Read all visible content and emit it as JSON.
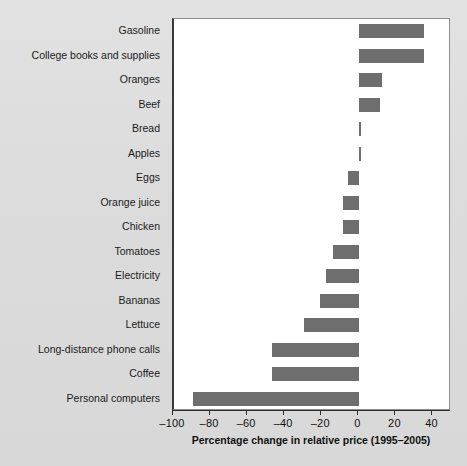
{
  "chart_data": {
    "type": "bar",
    "orientation": "horizontal",
    "title": "",
    "xlabel": "Percentage change in relative price (1995–2005)",
    "ylabel": "",
    "xlim": [
      -100,
      50
    ],
    "xticks": [
      -100,
      -80,
      -60,
      -40,
      -20,
      0,
      20,
      40
    ],
    "xtick_labels": [
      "–100",
      "–80",
      "–60",
      "–40",
      "–20",
      "0",
      "20",
      "40"
    ],
    "grid": false,
    "legend": null,
    "bar_color": "#6e6e6e",
    "plot_background": "#ffffff",
    "figure_background": "#dcdcdc",
    "categories": [
      "Gasoline",
      "College books and supplies",
      "Oranges",
      "Beef",
      "Bread",
      "Apples",
      "Eggs",
      "Orange juice",
      "Chicken",
      "Tomatoes",
      "Electricity",
      "Bananas",
      "Lettuce",
      "Long-distance phone calls",
      "Coffee",
      "Personal computers"
    ],
    "values": [
      35,
      35,
      12,
      11,
      1,
      0,
      -6,
      -9,
      -9,
      -14,
      -18,
      -21,
      -30,
      -47,
      -47,
      -90
    ]
  }
}
